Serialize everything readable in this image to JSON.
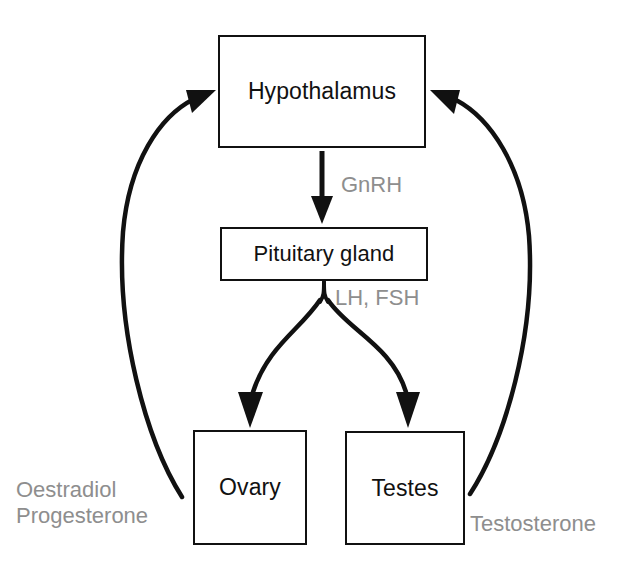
{
  "diagram": {
    "colors": {
      "stroke": "#111111",
      "box_fill": "#ffffff",
      "label_gray": "#8e8e8e",
      "background": "#ffffff"
    },
    "nodes": [
      {
        "id": "hypothalamus",
        "label": "Hypothalamus"
      },
      {
        "id": "pituitary",
        "label": "Pituitary gland"
      },
      {
        "id": "ovary",
        "label": "Ovary"
      },
      {
        "id": "testes",
        "label": "Testes"
      }
    ],
    "edge_labels": {
      "gnrh": "GnRH",
      "lh_fsh": "LH, FSH",
      "oestradiol": "Oestradiol",
      "progesterone": "Progesterone",
      "testosterone": "Testosterone"
    },
    "edges": [
      {
        "id": "hypothalamus-to-pituitary",
        "from": "hypothalamus",
        "to": "pituitary",
        "label": "GnRH",
        "style": "straight-arrow"
      },
      {
        "id": "pituitary-to-ovary",
        "from": "pituitary",
        "to": "ovary",
        "label": "LH, FSH",
        "style": "curved-branch-arrow"
      },
      {
        "id": "pituitary-to-testes",
        "from": "pituitary",
        "to": "testes",
        "label": "LH, FSH",
        "style": "curved-branch-arrow"
      },
      {
        "id": "ovary-to-hypothalamus",
        "from": "ovary",
        "to": "hypothalamus",
        "label": "Oestradiol Progesterone",
        "style": "curved-feedback-arrow"
      },
      {
        "id": "testes-to-hypothalamus",
        "from": "testes",
        "to": "hypothalamus",
        "label": "Testosterone",
        "style": "curved-feedback-arrow"
      }
    ]
  }
}
